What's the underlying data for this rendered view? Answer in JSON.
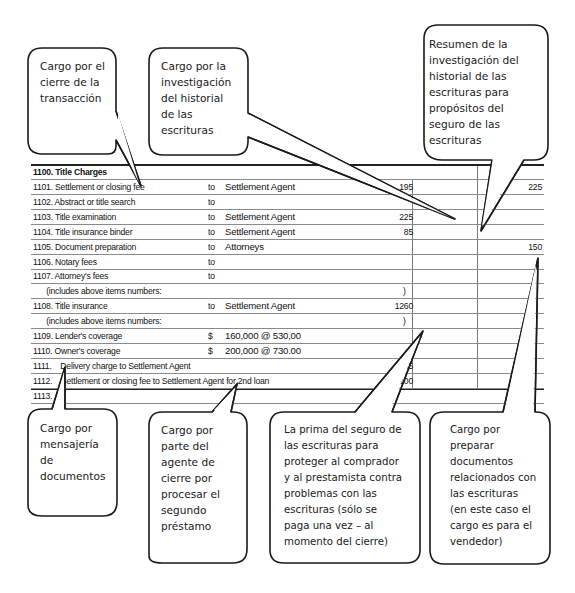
{
  "section": {
    "title": "1100. Title Charges"
  },
  "rows": [
    {
      "label": "1101. Settlement or closing fee",
      "to": "to",
      "payee": "Settlement Agent",
      "paren": "",
      "amount_borrower": "195",
      "amount_seller": "225"
    },
    {
      "label": "1102. Abstract or title search",
      "to": "to",
      "payee": "",
      "paren": "",
      "amount_borrower": "",
      "amount_seller": ""
    },
    {
      "label": "1103. Title examination",
      "to": "to",
      "payee": "Settlement Agent",
      "paren": "",
      "amount_borrower": "225",
      "amount_seller": ""
    },
    {
      "label": "1104. Title insurance binder",
      "to": "to",
      "payee": "Settlement Agent",
      "paren": "",
      "amount_borrower": "85",
      "amount_seller": ""
    },
    {
      "label": "1105. Document preparation",
      "to": "to",
      "payee": "Attorneys",
      "paren": "",
      "amount_borrower": "",
      "amount_seller": "150"
    },
    {
      "label": "1106. Notary fees",
      "to": "to",
      "payee": "",
      "paren": "",
      "amount_borrower": "",
      "amount_seller": ""
    },
    {
      "label": "1107. Attorney's fees",
      "to": "to",
      "payee": "",
      "paren": "",
      "amount_borrower": "",
      "amount_seller": ""
    },
    {
      "label": "      (includes above items numbers:",
      "to": "",
      "payee": "",
      "paren": ")",
      "amount_borrower": "",
      "amount_seller": ""
    },
    {
      "label": "1108. Title insurance",
      "to": "to",
      "payee": "Settlement Agent",
      "paren": "",
      "amount_borrower": "1260",
      "amount_seller": ""
    },
    {
      "label": "      (includes above items numbers:",
      "to": "",
      "payee": "",
      "paren": ")",
      "amount_borrower": "",
      "amount_seller": ""
    },
    {
      "label": "1109. Lender's coverage",
      "to": "$",
      "payee": "160,000 @ 530,00",
      "paren": "",
      "amount_borrower": "",
      "amount_seller": ""
    },
    {
      "label": "1110. Owner's coverage",
      "to": "$",
      "payee": "200,000 @ 730.00",
      "paren": "",
      "amount_borrower": "",
      "amount_seller": ""
    },
    {
      "label": "1111.    Delivery charge to Settlement Agent",
      "to": "",
      "payee": "",
      "paren": "",
      "amount_borrower": "55",
      "amount_seller": ""
    },
    {
      "label": "1112.    Settlement or closing fee to Settlement Agent for 2nd loan",
      "to": "",
      "payee": "",
      "paren": "",
      "amount_borrower": "100",
      "amount_seller": ""
    },
    {
      "label": "1113.",
      "to": "",
      "payee": "",
      "paren": "",
      "amount_borrower": "",
      "amount_seller": ""
    }
  ],
  "callouts": {
    "closing_fee": [
      "Cargo por el",
      "cierre de la",
      "transacción"
    ],
    "title_search": [
      "Cargo por la",
      "investigación",
      "del historial",
      "de las",
      "escrituras"
    ],
    "binder": [
      "Resumen de la",
      "investigación del",
      "historial de las",
      "escrituras para",
      "propósitos del",
      "seguro de las",
      "escrituras"
    ],
    "delivery": [
      "Cargo por",
      "mensajería",
      "de",
      "documentos"
    ],
    "second_loan": [
      "Cargo por",
      "parte del",
      "agente de",
      "cierre por",
      "procesar el",
      "segundo",
      "préstamo"
    ],
    "title_insurance": [
      "La prima del seguro de",
      "las escrituras para",
      "proteger al comprador",
      "y al prestamista contra",
      "problemas con las",
      "escrituras (sólo se",
      "paga una vez – al",
      "momento del cierre)"
    ],
    "doc_prep": [
      "Cargo por",
      "preparar",
      "documentos",
      "relacionados con",
      "las escrituras",
      "(en este caso el",
      "cargo es para el",
      "vendedor)"
    ]
  }
}
